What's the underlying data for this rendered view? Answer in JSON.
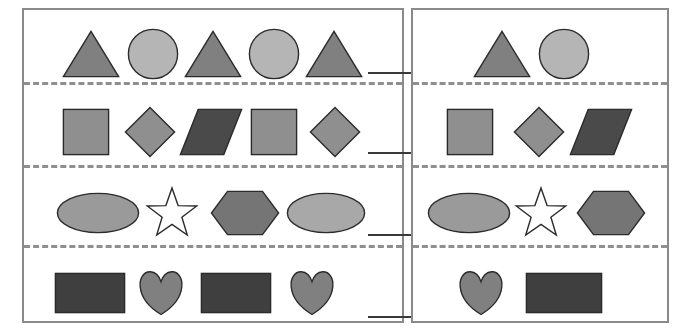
{
  "worksheet": {
    "title": "Shape Pattern Worksheet",
    "panel_left_label": "left-pattern-panel",
    "panel_right_label": "right-pattern-panel",
    "background_color": "#ffffff",
    "frame_color": "#8a8a8a",
    "dash_color": "#8f8f8f",
    "blank_color": "#3a3a3a",
    "outline_color": "#2b2b2b"
  },
  "palette": {
    "triangle_gray": "#808080",
    "circle_light": "#b5b5b5",
    "square_gray": "#8f8f8f",
    "diamond_gray": "#8f8f8f",
    "parallelogram_dark": "#4a4a4a",
    "ellipse_gray": "#9a9a9a",
    "ellipse_light": "#a8a8a8",
    "star_white": "#ffffff",
    "hexagon_gray": "#757575",
    "rectangle_dark": "#3f3f3f",
    "heart_gray": "#808080"
  },
  "panels": [
    {
      "id": "left",
      "name": "left-pattern-panel",
      "rows": [
        {
          "id": "row-1",
          "name": "pattern-row-triangles-circles",
          "has_blank": true,
          "blank": {
            "x": 344,
            "y": 62,
            "width": 44
          },
          "shapes": [
            {
              "type": "triangle",
              "name": "triangle-shape",
              "fill": "#808080",
              "x": 38,
              "y": 20,
              "w": 58,
              "h": 48
            },
            {
              "type": "circle",
              "name": "circle-shape",
              "fill": "#b5b5b5",
              "x": 103,
              "y": 18,
              "w": 52,
              "h": 52
            },
            {
              "type": "triangle",
              "name": "triangle-shape",
              "fill": "#808080",
              "x": 160,
              "y": 20,
              "w": 58,
              "h": 48
            },
            {
              "type": "circle",
              "name": "circle-shape",
              "fill": "#b5b5b5",
              "x": 224,
              "y": 18,
              "w": 52,
              "h": 52
            },
            {
              "type": "triangle",
              "name": "triangle-shape",
              "fill": "#808080",
              "x": 281,
              "y": 20,
              "w": 58,
              "h": 48
            }
          ]
        },
        {
          "id": "row-2",
          "name": "pattern-row-squares-diamonds-parallelogram",
          "has_blank": true,
          "blank": {
            "x": 344,
            "y": 142,
            "width": 44
          },
          "shapes": [
            {
              "type": "square",
              "name": "square-shape",
              "fill": "#8f8f8f",
              "x": 38,
              "y": 98,
              "w": 48,
              "h": 48
            },
            {
              "type": "diamond",
              "name": "diamond-shape",
              "fill": "#8f8f8f",
              "x": 100,
              "y": 96,
              "w": 52,
              "h": 52
            },
            {
              "type": "parallelogram",
              "name": "parallelogram-shape",
              "fill": "#4a4a4a",
              "x": 155,
              "y": 98,
              "w": 64,
              "h": 48
            },
            {
              "type": "square",
              "name": "square-shape",
              "fill": "#8f8f8f",
              "x": 226,
              "y": 98,
              "w": 48,
              "h": 48
            },
            {
              "type": "diamond",
              "name": "diamond-shape",
              "fill": "#8f8f8f",
              "x": 285,
              "y": 96,
              "w": 52,
              "h": 52
            }
          ]
        },
        {
          "id": "row-3",
          "name": "pattern-row-ellipses-star-hexagon",
          "has_blank": true,
          "blank": {
            "x": 344,
            "y": 224,
            "width": 44
          },
          "shapes": [
            {
              "type": "ellipse",
              "name": "ellipse-shape",
              "fill": "#9a9a9a",
              "x": 32,
              "y": 182,
              "w": 84,
              "h": 42
            },
            {
              "type": "star",
              "name": "star-shape",
              "fill": "#ffffff",
              "x": 120,
              "y": 176,
              "w": 56,
              "h": 54
            },
            {
              "type": "hexagon",
              "name": "hexagon-shape",
              "fill": "#757575",
              "x": 186,
              "y": 180,
              "w": 70,
              "h": 46
            },
            {
              "type": "ellipse",
              "name": "ellipse-shape",
              "fill": "#a8a8a8",
              "x": 262,
              "y": 182,
              "w": 80,
              "h": 42
            }
          ]
        },
        {
          "id": "row-4",
          "name": "pattern-row-rectangles-hearts",
          "has_blank": true,
          "blank": {
            "x": 344,
            "y": 306,
            "width": 44
          },
          "shapes": [
            {
              "type": "rectangle",
              "name": "rectangle-shape",
              "fill": "#3f3f3f",
              "x": 30,
              "y": 262,
              "w": 72,
              "h": 42
            },
            {
              "type": "heart",
              "name": "heart-shape",
              "fill": "#808080",
              "x": 111,
              "y": 258,
              "w": 52,
              "h": 48
            },
            {
              "type": "rectangle",
              "name": "rectangle-shape",
              "fill": "#3f3f3f",
              "x": 176,
              "y": 262,
              "w": 72,
              "h": 42
            },
            {
              "type": "heart",
              "name": "heart-shape",
              "fill": "#808080",
              "x": 262,
              "y": 258,
              "w": 52,
              "h": 48
            }
          ]
        }
      ],
      "dash_lines_y": [
        72,
        155,
        235
      ]
    },
    {
      "id": "right",
      "name": "right-pattern-panel",
      "rows": [
        {
          "id": "row-1",
          "name": "answer-row-triangle-circle",
          "has_blank": false,
          "shapes": [
            {
              "type": "triangle",
              "name": "triangle-shape",
              "fill": "#808080",
              "x": 60,
              "y": 20,
              "w": 58,
              "h": 48
            },
            {
              "type": "circle",
              "name": "circle-shape",
              "fill": "#b5b5b5",
              "x": 125,
              "y": 18,
              "w": 52,
              "h": 52
            }
          ]
        },
        {
          "id": "row-2",
          "name": "answer-row-square-diamond-parallelogram",
          "has_blank": false,
          "shapes": [
            {
              "type": "square",
              "name": "square-shape",
              "fill": "#8f8f8f",
              "x": 33,
              "y": 98,
              "w": 48,
              "h": 48
            },
            {
              "type": "diamond",
              "name": "diamond-shape",
              "fill": "#8f8f8f",
              "x": 100,
              "y": 96,
              "w": 52,
              "h": 52
            },
            {
              "type": "parallelogram",
              "name": "parallelogram-shape",
              "fill": "#4a4a4a",
              "x": 156,
              "y": 98,
              "w": 64,
              "h": 48
            }
          ]
        },
        {
          "id": "row-3",
          "name": "answer-row-ellipse-star-hexagon",
          "has_blank": false,
          "shapes": [
            {
              "type": "ellipse",
              "name": "ellipse-shape",
              "fill": "#9a9a9a",
              "x": 14,
              "y": 182,
              "w": 84,
              "h": 42
            },
            {
              "type": "star",
              "name": "star-shape",
              "fill": "#ffffff",
              "x": 100,
              "y": 176,
              "w": 56,
              "h": 54
            },
            {
              "type": "hexagon",
              "name": "hexagon-shape",
              "fill": "#757575",
              "x": 163,
              "y": 180,
              "w": 70,
              "h": 46
            }
          ]
        },
        {
          "id": "row-4",
          "name": "answer-row-heart-rectangle",
          "has_blank": false,
          "shapes": [
            {
              "type": "heart",
              "name": "heart-shape",
              "fill": "#808080",
              "x": 42,
              "y": 258,
              "w": 52,
              "h": 48
            },
            {
              "type": "rectangle",
              "name": "rectangle-shape",
              "fill": "#3f3f3f",
              "x": 112,
              "y": 262,
              "w": 78,
              "h": 42
            }
          ]
        }
      ],
      "dash_lines_y": [
        72,
        155,
        235
      ]
    }
  ]
}
